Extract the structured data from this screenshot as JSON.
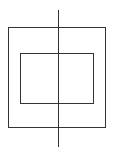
{
  "diagram": {
    "width": 116,
    "height": 157,
    "background": "#ffffff",
    "stroke_color": "#333333",
    "stroke_width": 1,
    "shapes": [
      {
        "id": "outer-rect",
        "type": "rect",
        "x": 8.5,
        "y": 27.5,
        "width": 97,
        "height": 100
      },
      {
        "id": "inner-rect",
        "type": "rect",
        "x": 20.5,
        "y": 53.5,
        "width": 73,
        "height": 50
      },
      {
        "id": "vertical-axis",
        "type": "line",
        "x1": 58.5,
        "y1": 10,
        "x2": 58.5,
        "y2": 147
      }
    ]
  }
}
